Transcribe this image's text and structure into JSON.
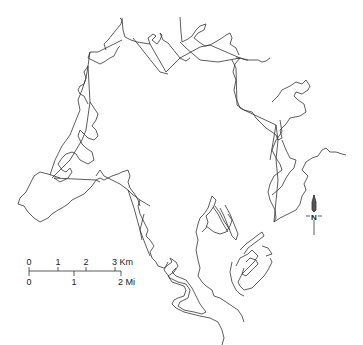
{
  "map": {
    "type": "outline-map",
    "line_color": "#333333",
    "background": "#ffffff"
  },
  "scale_bar": {
    "km_labels": [
      "0",
      "1",
      "2",
      "3 Km"
    ],
    "mi_labels": [
      "0",
      "1",
      "2 Mi"
    ]
  },
  "north_arrow": {
    "label": "N"
  }
}
